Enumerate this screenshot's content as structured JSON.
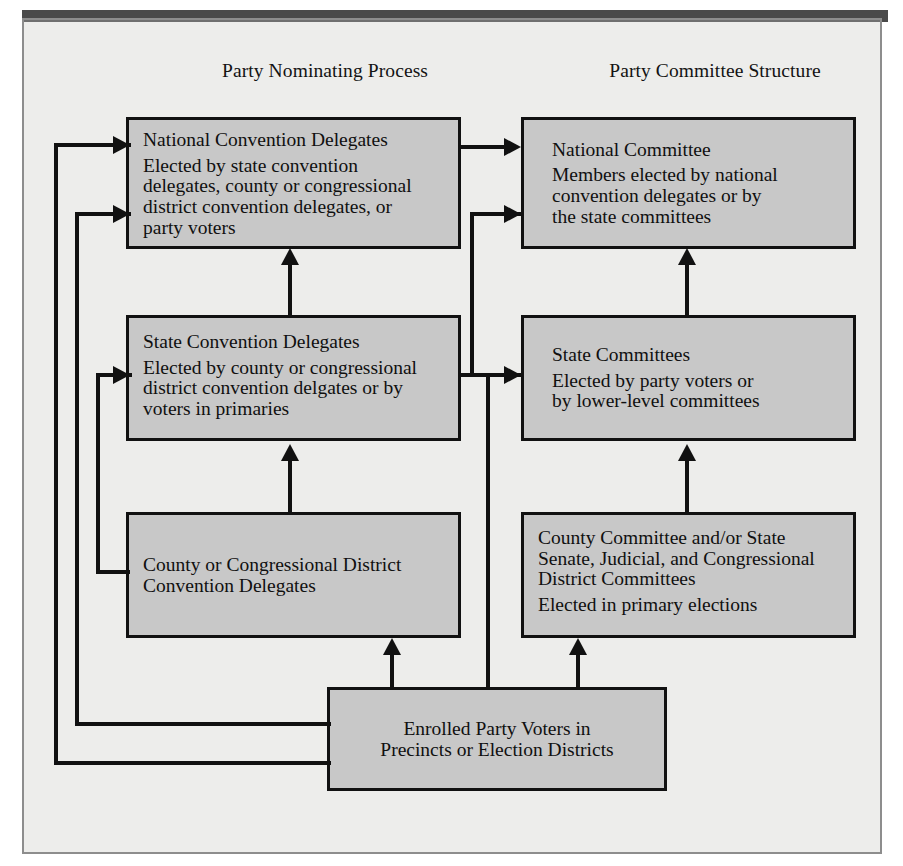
{
  "figure": {
    "background_color": "#ededeb",
    "box_fill_color": "#c8c8c8",
    "line_color": "#111111"
  },
  "columns": [
    {
      "id": "nominating",
      "label": "Party Nominating Process"
    },
    {
      "id": "committee",
      "label": "Party Committee Structure"
    }
  ],
  "nodes": {
    "national_convention": {
      "title": "National Convention Delegates",
      "lines": [
        "Elected by state convention",
        "delegates, county or congressional",
        "district convention delegates, or",
        "party voters"
      ]
    },
    "national_committee": {
      "title": "National Committee",
      "lines": [
        "Members elected by national",
        "convention delegates or by",
        "the state committees"
      ]
    },
    "state_convention": {
      "title": "State Convention Delegates",
      "lines": [
        "Elected by county or congressional",
        "district convention delgates or by",
        "voters in primaries"
      ]
    },
    "state_committees": {
      "title": "State Committees",
      "lines": [
        "Elected by party voters or",
        "by lower-level committees"
      ]
    },
    "county_convention": {
      "title": "County or Congressional District",
      "lines": [
        "Convention Delegates"
      ]
    },
    "county_committee": {
      "title": "County Committee and/or State",
      "lines": [
        "Senate, Judicial, and Congressional",
        "District Committees",
        "Elected in primary elections"
      ]
    },
    "enrolled_voters": {
      "title": "Enrolled Party Voters in",
      "lines": [
        "Precincts or Election Districts"
      ]
    }
  },
  "connections": [
    {
      "from": "national_convention",
      "to": "national_committee",
      "direction": "right"
    },
    {
      "from": "state_convention",
      "to": "national_convention",
      "direction": "up"
    },
    {
      "from": "county_convention",
      "to": "state_convention",
      "direction": "up"
    },
    {
      "from": "state_committees",
      "to": "national_committee",
      "direction": "up"
    },
    {
      "from": "county_committee",
      "to": "state_committees",
      "direction": "up"
    },
    {
      "from": "enrolled_voters",
      "to": "county_convention",
      "direction": "up"
    },
    {
      "from": "enrolled_voters",
      "to": "county_committee",
      "direction": "up"
    },
    {
      "from": "enrolled_voters",
      "to": "state_committees",
      "direction": "right"
    },
    {
      "from": "state_convention",
      "to": "national_committee",
      "direction": "right"
    },
    {
      "from": "enrolled_voters",
      "to": "national_convention",
      "direction": "right"
    },
    {
      "from": "enrolled_voters",
      "to": "national_convention",
      "direction": "right"
    },
    {
      "from": "county_convention",
      "to": "state_convention",
      "direction": "right"
    }
  ]
}
